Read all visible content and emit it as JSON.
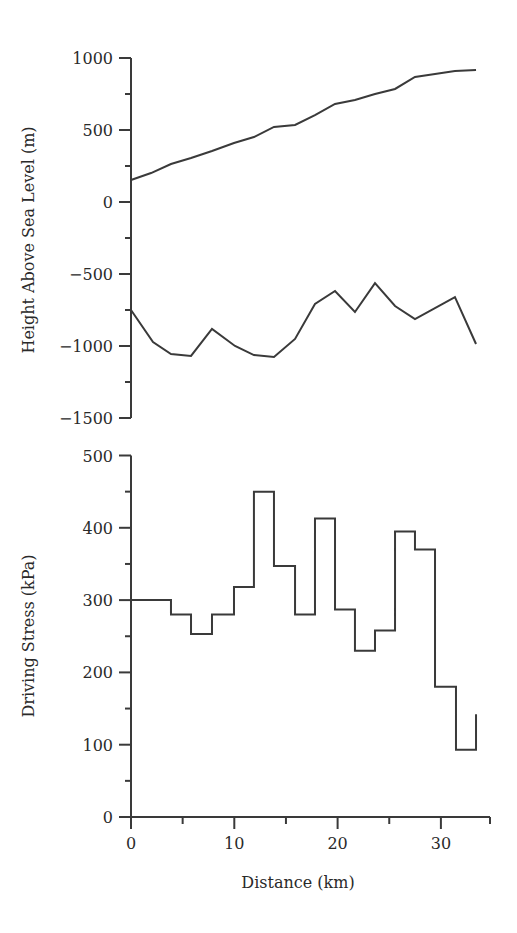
{
  "colors": {
    "line": "#3a3a3a",
    "background": "#ffffff"
  },
  "chart_data": [
    {
      "type": "line",
      "title": "",
      "xlabel": "",
      "ylabel": "Height Above Sea Level (m)",
      "xlim": [
        0,
        35
      ],
      "ylim": [
        -1500,
        1000
      ],
      "yticks": [
        1000,
        500,
        0,
        -500,
        -1000,
        -1500
      ],
      "ytick_labels": [
        "1000",
        "500",
        "0",
        "−500",
        "−1000",
        "−1500"
      ],
      "yminor_step": 250,
      "grid": false,
      "legend": null,
      "series": [
        {
          "name": "Surface elevation",
          "x": [
            0,
            1.94,
            3.87,
            5.81,
            7.84,
            9.97,
            11.9,
            13.84,
            15.88,
            17.81,
            19.75,
            21.68,
            23.62,
            25.56,
            27.49,
            29.43,
            31.36,
            33.4
          ],
          "y": [
            153,
            201,
            264,
            306,
            354,
            410,
            451,
            521,
            535,
            604,
            681,
            708,
            750,
            785,
            868,
            889,
            910,
            917
          ]
        },
        {
          "name": "Bed elevation",
          "x": [
            0,
            2.13,
            3.87,
            5.81,
            7.84,
            10.07,
            11.9,
            13.84,
            15.88,
            17.81,
            19.75,
            21.68,
            23.62,
            25.56,
            27.49,
            31.36,
            33.4
          ],
          "y": [
            -750,
            -972,
            -1056,
            -1069,
            -882,
            -1000,
            -1063,
            -1076,
            -951,
            -708,
            -618,
            -764,
            -563,
            -722,
            -813,
            -660,
            -986
          ]
        }
      ]
    },
    {
      "type": "line",
      "step": true,
      "title": "",
      "xlabel": "Distance (km)",
      "ylabel": "Driving Stress (kPa)",
      "xlim": [
        0,
        35
      ],
      "ylim": [
        0,
        500
      ],
      "xticks": [
        0,
        10,
        20,
        30
      ],
      "xtick_labels": [
        "0",
        "10",
        "20",
        "30"
      ],
      "xminor_step": 5,
      "yticks": [
        0,
        100,
        200,
        300,
        400,
        500
      ],
      "ytick_labels": [
        "0",
        "100",
        "200",
        "300",
        "400",
        "500"
      ],
      "yminor_step": 50,
      "grid": false,
      "legend": null,
      "series": [
        {
          "name": "Driving stress",
          "x_edges": [
            0,
            3.87,
            5.81,
            7.84,
            9.97,
            11.9,
            13.84,
            15.88,
            17.81,
            19.75,
            21.68,
            23.62,
            25.56,
            27.49,
            29.43,
            31.46,
            33.4
          ],
          "values": [
            300,
            280,
            253,
            280,
            318,
            450,
            347,
            280,
            413,
            287,
            230,
            258,
            395,
            370,
            180,
            93
          ],
          "end_value": 142
        }
      ]
    }
  ]
}
